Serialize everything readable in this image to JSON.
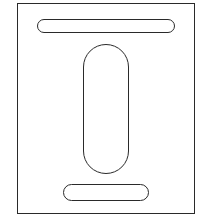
{
  "diagram": {
    "type": "plate-with-slots",
    "stroke_color": "#2a2a2a",
    "fill_color": "#ffffff",
    "plate": {
      "x": 17,
      "y": 3,
      "width": 178,
      "height": 211
    },
    "slots": [
      {
        "name": "top-horizontal-slot",
        "x": 37,
        "y": 19,
        "width": 138,
        "height": 14,
        "orientation": "horizontal"
      },
      {
        "name": "center-vertical-slot",
        "x": 83,
        "y": 44,
        "width": 46,
        "height": 130,
        "orientation": "vertical"
      },
      {
        "name": "bottom-horizontal-slot",
        "x": 63,
        "y": 184,
        "width": 86,
        "height": 17,
        "orientation": "horizontal"
      }
    ]
  }
}
